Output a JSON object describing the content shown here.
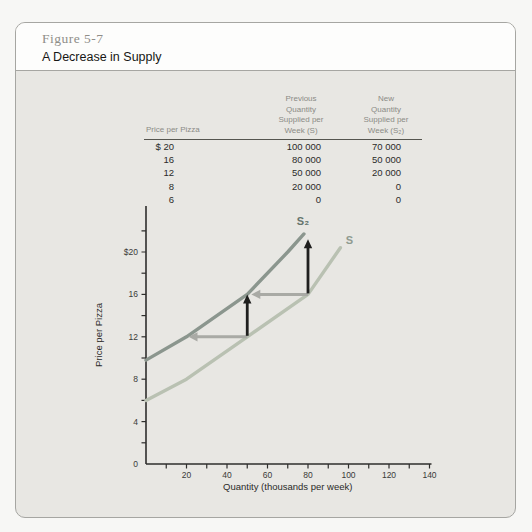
{
  "figure": {
    "label": "Figure 5-7",
    "title": "A Decrease in Supply"
  },
  "table": {
    "headers": {
      "price": "Price per Pizza",
      "previous": "Previous\nQuantity\nSupplied per\nWeek (S)",
      "new": "New\nQuantity\nSupplied per\nWeek (S₂)"
    },
    "rows": [
      {
        "price": "$ 20",
        "previous": "100 000",
        "new": "70 000"
      },
      {
        "price": "16",
        "previous": "80 000",
        "new": "50 000"
      },
      {
        "price": "12",
        "previous": "50 000",
        "new": "20 000"
      },
      {
        "price": "8",
        "previous": "20 000",
        "new": "0"
      },
      {
        "price": "6",
        "previous": "0",
        "new": "0"
      }
    ]
  },
  "chart_data": {
    "type": "line",
    "xlabel": "Quantity (thousands per week)",
    "ylabel": "Price per Pizza",
    "xlim": [
      0,
      140
    ],
    "ylim": [
      0,
      24
    ],
    "x_minor_step": 10,
    "y_minor_step": 2,
    "x_ticks": [
      {
        "v": 20,
        "t": "20"
      },
      {
        "v": 40,
        "t": "40"
      },
      {
        "v": 60,
        "t": "60"
      },
      {
        "v": 80,
        "t": "80"
      },
      {
        "v": 100,
        "t": "100"
      },
      {
        "v": 120,
        "t": "120"
      },
      {
        "v": 140,
        "t": "140"
      }
    ],
    "y_ticks": [
      {
        "v": 20,
        "t": "$20"
      },
      {
        "v": 16,
        "t": "16"
      },
      {
        "v": 12,
        "t": "12"
      },
      {
        "v": 8,
        "t": "8"
      },
      {
        "v": 4,
        "t": "4"
      },
      {
        "v": 0,
        "t": "0"
      }
    ],
    "series": [
      {
        "id": "s",
        "name": "S",
        "color": "#b9c1b2",
        "label_color": "#8f9b90",
        "points": [
          [
            0,
            6
          ],
          [
            20,
            8
          ],
          [
            50,
            12
          ],
          [
            80,
            16
          ],
          [
            96,
            20.4
          ]
        ],
        "label_q": 100.5,
        "label_p": 21.0
      },
      {
        "id": "s2",
        "name": "S₂",
        "color": "#8b968e",
        "label_color": "#66756d",
        "points": [
          [
            0,
            9.8
          ],
          [
            20,
            12
          ],
          [
            50,
            16
          ],
          [
            70,
            20
          ],
          [
            78,
            21.7
          ]
        ],
        "label_q": 77.5,
        "label_p": 22.8
      }
    ],
    "shift_arrows": [
      {
        "price": 12,
        "from_q": 50,
        "to_q": 21
      },
      {
        "price": 16,
        "from_q": 80,
        "to_q": 52
      }
    ],
    "price_arrows": [
      {
        "q": 50,
        "from_price": 12,
        "to_price": 16
      },
      {
        "q": 80,
        "from_price": 16,
        "to_price": 21.2
      }
    ],
    "legend": "none",
    "grid": false
  },
  "colors": {
    "panel_bg": "#e8e7e3",
    "header_bg": "#fdfdfc",
    "card_border": "#a6a6a2",
    "axis": "#2e2e2c",
    "tick_label": "#3a3a38",
    "axis_title": "#2b2b29",
    "shift_arrow": "#a9aaa5",
    "price_arrow": "#1f1f1e",
    "table_header_text": "#8b8b86",
    "table_data_text": "#2b2b29",
    "figure_label_text": "#8f8e89"
  }
}
